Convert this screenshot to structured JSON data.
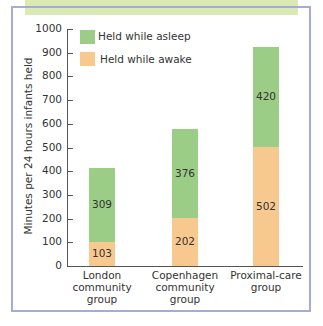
{
  "chart_data": {
    "type": "bar",
    "stacked": true,
    "title": "",
    "xlabel": "",
    "ylabel": "Minutes per 24 hours infants held",
    "ylim": [
      0,
      1000
    ],
    "yticks": [
      "0",
      "100",
      "200",
      "300",
      "400",
      "500",
      "600",
      "700",
      "800",
      "900",
      "1000"
    ],
    "categories": [
      [
        "London",
        "community",
        "group"
      ],
      [
        "Copenhagen",
        "community",
        "group"
      ],
      [
        "Proximal-care",
        "group"
      ]
    ],
    "series": [
      {
        "name": "Held while awake",
        "color": "#f8c98e",
        "values": [
          103,
          202,
          502
        ]
      },
      {
        "name": "Held while asleep",
        "color": "#9ccd86",
        "values": [
          309,
          376,
          420
        ]
      }
    ],
    "legend": {
      "position": "top-left-inside",
      "entries": [
        "Held while asleep",
        "Held while awake"
      ]
    },
    "grid": false
  }
}
